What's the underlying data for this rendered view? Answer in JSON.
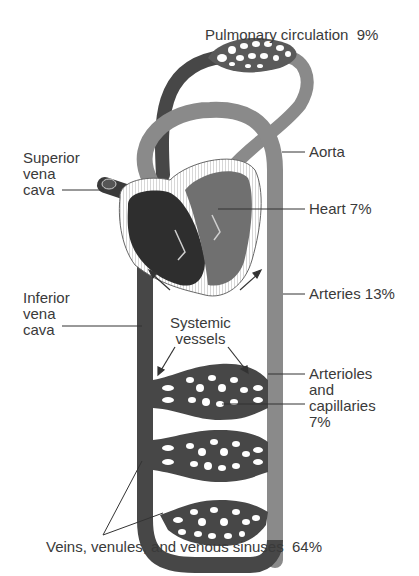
{
  "diagram": {
    "colors": {
      "venous": "#474747",
      "arterial": "#8a8a8a",
      "heart_wall": "#ffffff",
      "line": "#333333",
      "text": "#3a3a3a",
      "background": "#ffffff"
    },
    "labels": {
      "pulmonary": "Pulmonary circulation  9%",
      "superior_vena_cava": "Superior\nvena\ncava",
      "aorta": "Aorta",
      "heart": "Heart 7%",
      "inferior_vena_cava": "Inferior\nvena\ncava",
      "arteries": "Arteries 13%",
      "systemic_vessels": "Systemic\nvessels",
      "arterioles_capillaries": "Arterioles\nand\ncapillaries\n7%",
      "veins": "Veins, venules, and venous sinuses  64%"
    },
    "blood_distribution": [
      {
        "component": "Pulmonary circulation",
        "percent": 9
      },
      {
        "component": "Heart",
        "percent": 7
      },
      {
        "component": "Arteries",
        "percent": 13
      },
      {
        "component": "Arterioles and capillaries",
        "percent": 7
      },
      {
        "component": "Veins, venules, and venous sinuses",
        "percent": 64
      }
    ]
  }
}
